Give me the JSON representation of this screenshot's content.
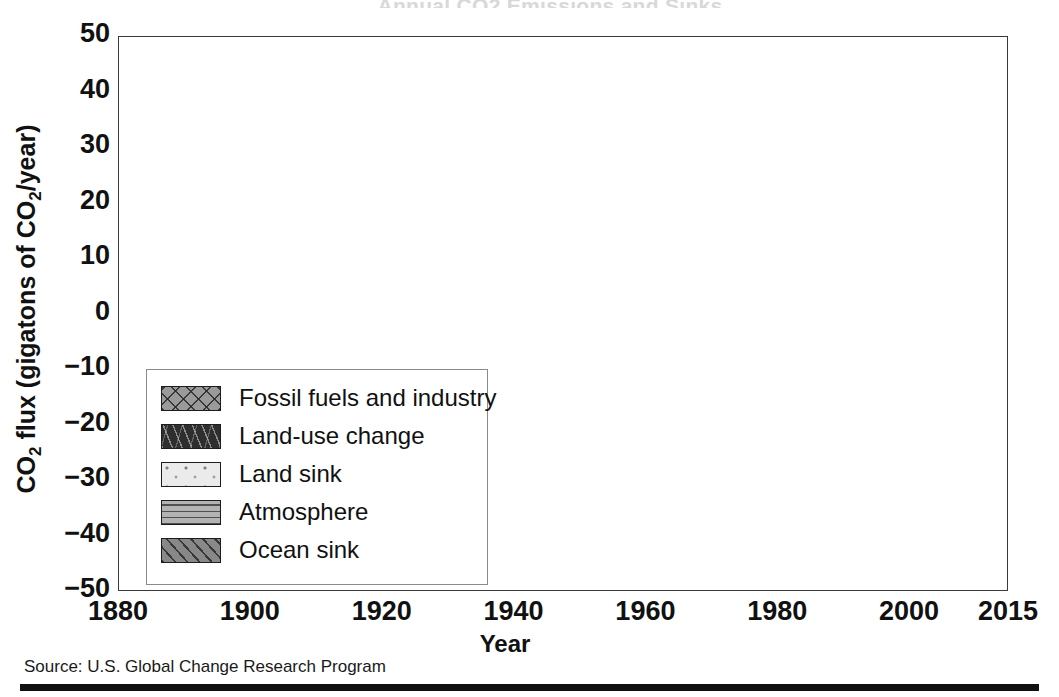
{
  "figure": {
    "title_remnant": "Annual CO2 Emissions and Sinks",
    "source": "Source: U.S. Global Change Research Program"
  },
  "legend": {
    "position": "inside-lower-left",
    "entries": [
      {
        "label": "Fossil fuels and industry",
        "swatch": "crosshatch-x-gray",
        "color": "#9a9a9a"
      },
      {
        "label": "Land-use change",
        "swatch": "dash-dark",
        "color": "#2e2e2e"
      },
      {
        "label": "Land sink",
        "swatch": "dotted-light",
        "color": "#ebebeb"
      },
      {
        "label": "Atmosphere",
        "swatch": "horizontal-lines-gray",
        "color": "#b3b3b3"
      },
      {
        "label": "Ocean sink",
        "swatch": "diagonal-hatch-gray",
        "color": "#888888"
      }
    ]
  },
  "chart_data": {
    "type": "area",
    "title": "",
    "xlabel": "Year",
    "ylabel": "CO2 flux (gigatons of CO2/year)",
    "ylabel_parts": {
      "pre": "CO",
      "sub1": "2",
      "mid": " flux (gigatons of CO",
      "sub2": "2",
      "post": "/year)"
    },
    "xlim": [
      1880,
      2015
    ],
    "ylim": [
      -50,
      50
    ],
    "xticks": [
      1880,
      1900,
      1920,
      1940,
      1960,
      1980,
      2000,
      2015
    ],
    "yticks": [
      50,
      40,
      30,
      20,
      10,
      0,
      -10,
      -20,
      -30,
      -40,
      -50
    ],
    "ytick_labels": [
      "50",
      "40",
      "30",
      "20",
      "10",
      "0",
      "−10",
      "−20",
      "−30",
      "−40",
      "−50"
    ],
    "grid": true,
    "grid_color": "#9b9b9b",
    "stacked": true,
    "note": "Sources plotted as positive stack (fossil fuels above land-use change); sinks plotted as negative stack (land sink, atmosphere, ocean sink).",
    "x": [
      1880,
      1885,
      1890,
      1895,
      1900,
      1905,
      1910,
      1915,
      1920,
      1925,
      1930,
      1935,
      1940,
      1945,
      1950,
      1955,
      1960,
      1965,
      1970,
      1975,
      1980,
      1985,
      1990,
      1995,
      2000,
      2005,
      2010,
      2015
    ],
    "series": [
      {
        "name": "Land-use change",
        "side": "positive",
        "stack_order": 1,
        "values": [
          2.0,
          2.0,
          2.1,
          2.1,
          2.2,
          2.3,
          2.4,
          2.4,
          2.5,
          2.8,
          2.9,
          3.0,
          3.2,
          3.6,
          4.0,
          4.3,
          4.5,
          4.6,
          4.6,
          4.6,
          4.6,
          4.8,
          5.0,
          5.2,
          5.0,
          4.7,
          4.5,
          4.4
        ]
      },
      {
        "name": "Fossil fuels and industry",
        "side": "positive",
        "stack_order": 2,
        "values": [
          1.5,
          1.7,
          2.0,
          2.4,
          2.8,
          3.2,
          3.6,
          3.3,
          3.6,
          4.0,
          4.2,
          4.3,
          4.8,
          5.4,
          6.5,
          9.0,
          11.5,
          14.5,
          19.0,
          22.5,
          25.0,
          26.0,
          27.5,
          27.5,
          29.0,
          32.0,
          35.0,
          35.6
        ]
      },
      {
        "name": "Land sink",
        "side": "negative",
        "stack_order": 1,
        "values": [
          -0.4,
          -0.4,
          -0.5,
          -0.5,
          -0.6,
          -0.7,
          -0.9,
          -1.0,
          -1.1,
          -1.3,
          -1.6,
          -1.9,
          -2.3,
          -2.8,
          -3.4,
          -4.4,
          -5.3,
          -6.2,
          -7.0,
          -7.2,
          -7.5,
          -8.0,
          -8.6,
          -8.2,
          -9.0,
          -9.5,
          -9.8,
          -10.0
        ]
      },
      {
        "name": "Atmosphere",
        "side": "negative",
        "stack_order": 2,
        "values": [
          -0.9,
          -1.0,
          -1.1,
          -1.1,
          -1.2,
          -1.3,
          -1.4,
          -1.4,
          -1.5,
          -1.8,
          -2.2,
          -2.6,
          -3.0,
          -3.5,
          -4.5,
          -6.0,
          -7.5,
          -9.0,
          -11.0,
          -12.0,
          -13.0,
          -14.0,
          -15.0,
          -16.0,
          -17.0,
          -18.0,
          -19.5,
          -20.5
        ]
      },
      {
        "name": "Ocean sink",
        "side": "negative",
        "stack_order": 3,
        "values": [
          -2.2,
          -2.3,
          -2.6,
          -2.8,
          -2.8,
          -2.9,
          -3.0,
          -2.9,
          -3.1,
          -3.4,
          -3.6,
          -3.8,
          -4.1,
          -4.5,
          -5.0,
          -5.6,
          -6.2,
          -6.6,
          -7.5,
          -8.2,
          -8.6,
          -9.0,
          -9.4,
          -9.8,
          -10.2,
          -10.6,
          -11.0,
          -11.3
        ]
      }
    ],
    "annotations": [
      {
        "text": "fossil fuel stack top reaches about 40 GtCO2/year at 2015",
        "x": 2015,
        "y": 40
      },
      {
        "text": "local peak near 1998 then dip",
        "x": 1998,
        "y": 32
      },
      {
        "text": "total sink stack reaches about -42 GtCO2/year at 2015",
        "x": 2015,
        "y": -42
      }
    ]
  }
}
